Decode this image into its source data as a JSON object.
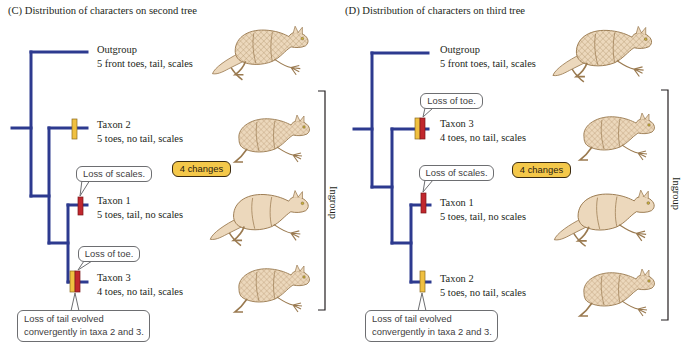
{
  "colors": {
    "branch": "#2d3a8f",
    "tail_change": "#f0c040",
    "other_change": "#c1272d",
    "badge_fill": "#f4c84a",
    "lizard_fill": "#ecd8bc",
    "lizard_outline": "#9a7a50"
  },
  "panels": [
    {
      "id": "C",
      "title": "(C) Distribution of characters on second tree",
      "taxa": [
        {
          "name": "Outgroup",
          "traits": "5 front toes, tail, scales"
        },
        {
          "name": "Taxon 2",
          "traits": "5 toes, no tail, scales"
        },
        {
          "name": "Taxon 1",
          "traits": "5 toes, tail, no scales"
        },
        {
          "name": "Taxon 3",
          "traits": "4 toes, no tail, scales"
        }
      ],
      "changes_badge": "4 changes",
      "callouts": {
        "scales": "Loss of scales.",
        "toe": "Loss of toe.",
        "tail_line1": "Loss of tail evolved",
        "tail_line2": "convergently in taxa 2 and 3."
      },
      "bracket_label": "Ingroup"
    },
    {
      "id": "D",
      "title": "(D) Distribution of characters on third tree",
      "taxa": [
        {
          "name": "Outgroup",
          "traits": "5 front toes, tail, scales"
        },
        {
          "name": "Taxon 3",
          "traits": "4 toes, no tail, scales"
        },
        {
          "name": "Taxon 1",
          "traits": "5 toes, tail, no scales"
        },
        {
          "name": "Taxon 2",
          "traits": "5 toes, no tail, scales"
        }
      ],
      "changes_badge": "4 changes",
      "callouts": {
        "toe": "Loss of toe.",
        "scales": "Loss of scales.",
        "tail_line1": "Loss of tail evolved",
        "tail_line2": "convergently in taxa 2 and 3."
      },
      "bracket_label": "Ingroup"
    }
  ]
}
